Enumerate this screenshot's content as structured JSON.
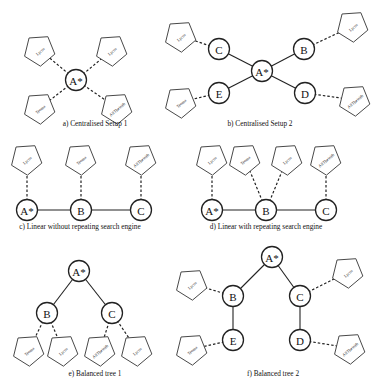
{
  "panels": [
    {
      "id": "a",
      "caption": "a) Centralised Setup 1",
      "caption_pos": [
        95,
        126
      ],
      "nodes": [
        {
          "label": "A*",
          "x": 76,
          "y": 80
        }
      ],
      "engines": [
        {
          "label": "Lycos",
          "x": 40,
          "y": 50,
          "rot": -40
        },
        {
          "label": "Lycos",
          "x": 112,
          "y": 50,
          "rot": -40
        },
        {
          "label": "Teoma",
          "x": 40,
          "y": 108,
          "rot": -40
        },
        {
          "label": "AllTheWeb",
          "x": 117,
          "y": 108,
          "rot": -40
        }
      ],
      "links": [
        {
          "from": "n0",
          "to": "e0",
          "style": "dashed"
        },
        {
          "from": "n0",
          "to": "e1",
          "style": "dashed"
        },
        {
          "from": "n0",
          "to": "e2",
          "style": "dashed"
        },
        {
          "from": "n0",
          "to": "e3",
          "style": "dashed"
        }
      ]
    },
    {
      "id": "b",
      "caption": "b) Centralised Setup 2",
      "caption_pos": [
        260,
        126
      ],
      "nodes": [
        {
          "label": "A*",
          "x": 262,
          "y": 71
        },
        {
          "label": "C",
          "x": 219,
          "y": 49
        },
        {
          "label": "B",
          "x": 304,
          "y": 49
        },
        {
          "label": "E",
          "x": 219,
          "y": 93
        },
        {
          "label": "D",
          "x": 305,
          "y": 93
        }
      ],
      "engines": [
        {
          "label": "Lycos",
          "x": 181,
          "y": 36,
          "rot": -40
        },
        {
          "label": "Lycos",
          "x": 353,
          "y": 26,
          "rot": -40
        },
        {
          "label": "Teoma",
          "x": 181,
          "y": 102,
          "rot": -40
        },
        {
          "label": "AllTheWeb",
          "x": 355,
          "y": 100,
          "rot": -40
        }
      ],
      "links": [
        {
          "from": "n0",
          "to": "n1",
          "style": "solid"
        },
        {
          "from": "n0",
          "to": "n2",
          "style": "solid"
        },
        {
          "from": "n0",
          "to": "n3",
          "style": "solid"
        },
        {
          "from": "n0",
          "to": "n4",
          "style": "solid"
        },
        {
          "from": "n1",
          "to": "e0",
          "style": "dashed"
        },
        {
          "from": "n2",
          "to": "e1",
          "style": "dashed"
        },
        {
          "from": "n3",
          "to": "e2",
          "style": "dashed"
        },
        {
          "from": "n4",
          "to": "e3",
          "style": "dashed"
        }
      ]
    },
    {
      "id": "c",
      "caption": "c) Linear without repeating search engine",
      "caption_pos": [
        80,
        229
      ],
      "nodes": [
        {
          "label": "A*",
          "x": 27,
          "y": 210
        },
        {
          "label": "B",
          "x": 81,
          "y": 210
        },
        {
          "label": "C",
          "x": 141,
          "y": 210
        }
      ],
      "engines": [
        {
          "label": "Lycos",
          "x": 27,
          "y": 159,
          "rot": -40
        },
        {
          "label": "Teoma",
          "x": 81,
          "y": 159,
          "rot": -40
        },
        {
          "label": "AllTheWeb",
          "x": 141,
          "y": 159,
          "rot": -40
        }
      ],
      "links": [
        {
          "from": "n0",
          "to": "n1",
          "style": "solid"
        },
        {
          "from": "n1",
          "to": "n2",
          "style": "solid"
        },
        {
          "from": "n0",
          "to": "e0",
          "style": "dashed"
        },
        {
          "from": "n1",
          "to": "e1",
          "style": "dashed"
        },
        {
          "from": "n2",
          "to": "e2",
          "style": "dashed"
        }
      ]
    },
    {
      "id": "d",
      "caption": "d) Linear with repeating search engine",
      "caption_pos": [
        266,
        229
      ],
      "nodes": [
        {
          "label": "A*",
          "x": 212,
          "y": 210
        },
        {
          "label": "B",
          "x": 266,
          "y": 210
        },
        {
          "label": "C",
          "x": 326,
          "y": 210
        }
      ],
      "engines": [
        {
          "label": "Lycos",
          "x": 212,
          "y": 159,
          "rot": -40
        },
        {
          "label": "Teoma",
          "x": 245,
          "y": 159,
          "rot": -40
        },
        {
          "label": "Lycos",
          "x": 287,
          "y": 159,
          "rot": -40
        },
        {
          "label": "AllTheWeb",
          "x": 326,
          "y": 159,
          "rot": -40
        }
      ],
      "links": [
        {
          "from": "n0",
          "to": "n1",
          "style": "solid"
        },
        {
          "from": "n1",
          "to": "n2",
          "style": "solid"
        },
        {
          "from": "n0",
          "to": "e0",
          "style": "dashed"
        },
        {
          "from": "n1",
          "to": "e1",
          "style": "dashed"
        },
        {
          "from": "n1",
          "to": "e2",
          "style": "dashed"
        },
        {
          "from": "n2",
          "to": "e3",
          "style": "dashed"
        }
      ]
    },
    {
      "id": "e",
      "caption": "e) Balanced tree 1",
      "caption_pos": [
        95,
        376
      ],
      "nodes": [
        {
          "label": "A*",
          "x": 79,
          "y": 271
        },
        {
          "label": "B",
          "x": 47,
          "y": 313
        },
        {
          "label": "C",
          "x": 112,
          "y": 313
        }
      ],
      "engines": [
        {
          "label": "Teoma",
          "x": 29,
          "y": 350,
          "rot": -40
        },
        {
          "label": "Lycos",
          "x": 63,
          "y": 350,
          "rot": -40
        },
        {
          "label": "AllTheWeb",
          "x": 100,
          "y": 350,
          "rot": -40
        },
        {
          "label": "Lycos",
          "x": 137,
          "y": 350,
          "rot": -40
        }
      ],
      "links": [
        {
          "from": "n0",
          "to": "n1",
          "style": "solid"
        },
        {
          "from": "n0",
          "to": "n2",
          "style": "solid"
        },
        {
          "from": "n1",
          "to": "e0",
          "style": "dashed"
        },
        {
          "from": "n1",
          "to": "e1",
          "style": "dashed"
        },
        {
          "from": "n2",
          "to": "e2",
          "style": "dashed"
        },
        {
          "from": "n2",
          "to": "e3",
          "style": "dashed"
        }
      ]
    },
    {
      "id": "f",
      "caption": "f) Balanced tree 2",
      "caption_pos": [
        273,
        376
      ],
      "nodes": [
        {
          "label": "A*",
          "x": 272,
          "y": 257
        },
        {
          "label": "B",
          "x": 233,
          "y": 296
        },
        {
          "label": "C",
          "x": 300,
          "y": 296
        },
        {
          "label": "E",
          "x": 233,
          "y": 340
        },
        {
          "label": "D",
          "x": 300,
          "y": 340
        }
      ],
      "engines": [
        {
          "label": "Lycos",
          "x": 192,
          "y": 284,
          "rot": -40
        },
        {
          "label": "Lycos",
          "x": 348,
          "y": 272,
          "rot": -40
        },
        {
          "label": "Teoma",
          "x": 192,
          "y": 349,
          "rot": -40
        },
        {
          "label": "AllTheWeb",
          "x": 350,
          "y": 348,
          "rot": -40
        }
      ],
      "links": [
        {
          "from": "n0",
          "to": "n1",
          "style": "solid"
        },
        {
          "from": "n0",
          "to": "n2",
          "style": "solid"
        },
        {
          "from": "n1",
          "to": "n3",
          "style": "solid"
        },
        {
          "from": "n2",
          "to": "n4",
          "style": "solid"
        },
        {
          "from": "n1",
          "to": "e0",
          "style": "dashed"
        },
        {
          "from": "n2",
          "to": "e1",
          "style": "dashed"
        },
        {
          "from": "n3",
          "to": "e2",
          "style": "dashed"
        },
        {
          "from": "n4",
          "to": "e3",
          "style": "dashed"
        }
      ]
    }
  ],
  "style": {
    "node_radius": 10.5,
    "engine_radius": 16,
    "line_color": "#222222",
    "background": "#ffffff"
  }
}
